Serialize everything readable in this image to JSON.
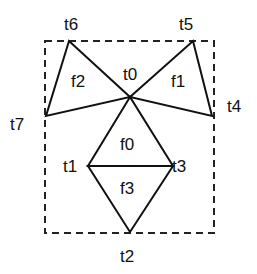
{
  "diagram": {
    "vertices": [
      {
        "id": "t0",
        "label": "t0",
        "x": 130,
        "y": 97,
        "lx": 123,
        "ly": 80
      },
      {
        "id": "t1",
        "label": "t1",
        "x": 88,
        "y": 166,
        "lx": 63,
        "ly": 172
      },
      {
        "id": "t2",
        "label": "t2",
        "x": 130,
        "y": 232,
        "lx": 120,
        "ly": 262
      },
      {
        "id": "t3",
        "label": "t3",
        "x": 173,
        "y": 166,
        "lx": 172,
        "ly": 172
      },
      {
        "id": "t4",
        "label": "t4",
        "x": 212,
        "y": 116,
        "lx": 227,
        "ly": 112
      },
      {
        "id": "t5",
        "label": "t5",
        "x": 193,
        "y": 41,
        "lx": 179,
        "ly": 30
      },
      {
        "id": "t6",
        "label": "t6",
        "x": 69,
        "y": 41,
        "lx": 64,
        "ly": 30
      },
      {
        "id": "t7",
        "label": "t7",
        "x": 46,
        "y": 116,
        "lx": 10,
        "ly": 130
      }
    ],
    "faces": [
      {
        "label": "f0",
        "x": 120,
        "y": 150
      },
      {
        "label": "f1",
        "x": 171,
        "y": 87
      },
      {
        "label": "f2",
        "x": 71,
        "y": 87
      },
      {
        "label": "f3",
        "x": 120,
        "y": 194
      }
    ],
    "bounding_box": {
      "x": 45,
      "y": 41,
      "w": 169,
      "h": 192
    }
  }
}
